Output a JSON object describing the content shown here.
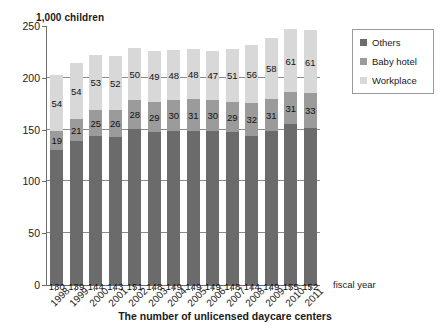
{
  "chart_data": {
    "type": "bar",
    "stacked": true,
    "title": "1,000 children",
    "caption": "The number of unlicensed daycare centers",
    "xlabel": "fiscal year",
    "ylabel": "1,000 children",
    "ylim": [
      0,
      250
    ],
    "yticks": [
      0,
      50,
      100,
      150,
      200,
      250
    ],
    "grid": true,
    "legend_position": "right",
    "categories": [
      "1998",
      "1999",
      "2000",
      "2001",
      "2002",
      "2003",
      "2004",
      "2005",
      "2006",
      "2007",
      "2008",
      "2009",
      "2010",
      "2011"
    ],
    "series": [
      {
        "name": "Others",
        "color": "#6b6b6b",
        "values": [
          130,
          139,
          144,
          143,
          151,
          148,
          149,
          149,
          149,
          148,
          144,
          149,
          155,
          152
        ]
      },
      {
        "name": "Baby hotel",
        "color": "#9b9b9b",
        "values": [
          19,
          21,
          25,
          26,
          28,
          29,
          30,
          31,
          30,
          29,
          32,
          31,
          31,
          33
        ]
      },
      {
        "name": "Workplace",
        "color": "#d8d8d8",
        "values": [
          54,
          54,
          53,
          52,
          50,
          49,
          48,
          48,
          47,
          51,
          56,
          58,
          61,
          61
        ]
      }
    ],
    "totals": [
      203,
      214,
      222,
      221,
      229,
      226,
      227,
      228,
      226,
      228,
      232,
      238,
      247,
      246
    ]
  },
  "legend": {
    "items": [
      {
        "label": "Others"
      },
      {
        "label": "Baby hotel"
      },
      {
        "label": "Workplace"
      }
    ]
  },
  "axis": {
    "x_name": "fiscal year"
  }
}
